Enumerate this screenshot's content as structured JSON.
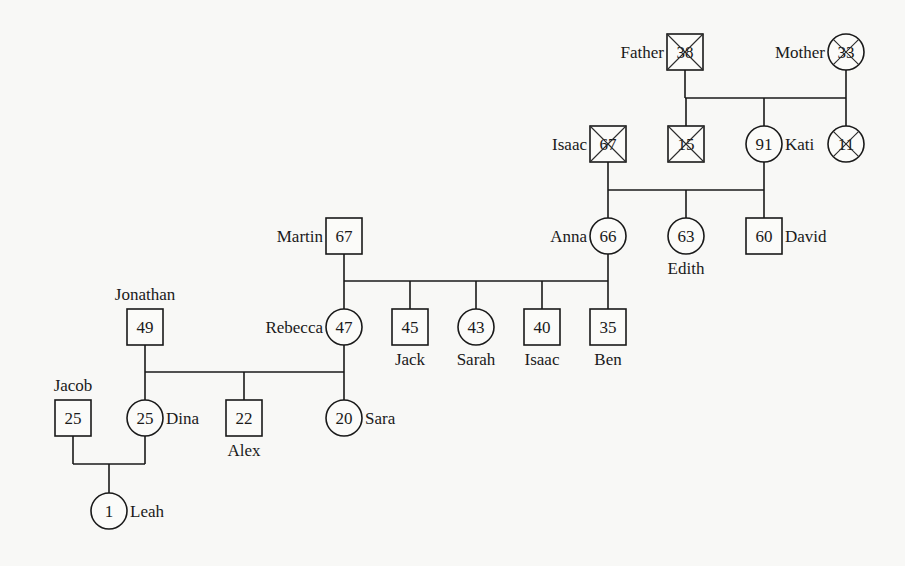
{
  "diagram": {
    "type": "pedigree",
    "colors": {
      "background": "#f8f8f6",
      "stroke": "#1a1a1a"
    },
    "people": [
      {
        "id": "father",
        "name": "Father",
        "age": "38",
        "sex": "male",
        "deceased": true,
        "x": 685,
        "y": 52,
        "label_pos": "left"
      },
      {
        "id": "mother",
        "name": "Mother",
        "age": "33",
        "sex": "female",
        "deceased": true,
        "x": 846,
        "y": 52,
        "label_pos": "left"
      },
      {
        "id": "isaac_sr",
        "name": "Isaac",
        "age": "67",
        "sex": "male",
        "deceased": true,
        "x": 608,
        "y": 144,
        "label_pos": "left"
      },
      {
        "id": "son15",
        "name": "",
        "age": "15",
        "sex": "male",
        "deceased": true,
        "x": 686,
        "y": 144,
        "label_pos": "none"
      },
      {
        "id": "kati",
        "name": "Kati",
        "age": "91",
        "sex": "female",
        "deceased": false,
        "x": 764,
        "y": 144,
        "label_pos": "right"
      },
      {
        "id": "daughter11",
        "name": "",
        "age": "11",
        "sex": "female",
        "deceased": true,
        "x": 846,
        "y": 144,
        "label_pos": "none"
      },
      {
        "id": "martin",
        "name": "Martin",
        "age": "67",
        "sex": "male",
        "deceased": false,
        "x": 344,
        "y": 236,
        "label_pos": "left"
      },
      {
        "id": "anna",
        "name": "Anna",
        "age": "66",
        "sex": "female",
        "deceased": false,
        "x": 608,
        "y": 236,
        "label_pos": "left"
      },
      {
        "id": "edith",
        "name": "Edith",
        "age": "63",
        "sex": "female",
        "deceased": false,
        "x": 686,
        "y": 236,
        "label_pos": "below"
      },
      {
        "id": "david",
        "name": "David",
        "age": "60",
        "sex": "male",
        "deceased": false,
        "x": 764,
        "y": 236,
        "label_pos": "right"
      },
      {
        "id": "jonathan",
        "name": "Jonathan",
        "age": "49",
        "sex": "male",
        "deceased": false,
        "x": 145,
        "y": 327,
        "label_pos": "above"
      },
      {
        "id": "rebecca",
        "name": "Rebecca",
        "age": "47",
        "sex": "female",
        "deceased": false,
        "x": 344,
        "y": 327,
        "label_pos": "left"
      },
      {
        "id": "jack",
        "name": "Jack",
        "age": "45",
        "sex": "male",
        "deceased": false,
        "x": 410,
        "y": 327,
        "label_pos": "below"
      },
      {
        "id": "sarah",
        "name": "Sarah",
        "age": "43",
        "sex": "female",
        "deceased": false,
        "x": 476,
        "y": 327,
        "label_pos": "below"
      },
      {
        "id": "isaac_jr",
        "name": "Isaac",
        "age": "40",
        "sex": "male",
        "deceased": false,
        "x": 542,
        "y": 327,
        "label_pos": "below"
      },
      {
        "id": "ben",
        "name": "Ben",
        "age": "35",
        "sex": "male",
        "deceased": false,
        "x": 608,
        "y": 327,
        "label_pos": "below"
      },
      {
        "id": "jacob",
        "name": "Jacob",
        "age": "25",
        "sex": "male",
        "deceased": false,
        "x": 73,
        "y": 418,
        "label_pos": "above"
      },
      {
        "id": "dina",
        "name": "Dina",
        "age": "25",
        "sex": "female",
        "deceased": false,
        "x": 145,
        "y": 418,
        "label_pos": "right"
      },
      {
        "id": "alex",
        "name": "Alex",
        "age": "22",
        "sex": "male",
        "deceased": false,
        "x": 244,
        "y": 418,
        "label_pos": "below"
      },
      {
        "id": "sara",
        "name": "Sara",
        "age": "20",
        "sex": "female",
        "deceased": false,
        "x": 344,
        "y": 418,
        "label_pos": "right"
      },
      {
        "id": "leah",
        "name": "Leah",
        "age": "1",
        "sex": "female",
        "deceased": false,
        "x": 109,
        "y": 511,
        "label_pos": "right"
      }
    ],
    "lines": [
      [
        685,
        70,
        685,
        98
      ],
      [
        846,
        70,
        846,
        98
      ],
      [
        685,
        98,
        846,
        98
      ],
      [
        686,
        98,
        686,
        126
      ],
      [
        764,
        98,
        764,
        126
      ],
      [
        846,
        98,
        846,
        126
      ],
      [
        608,
        162,
        608,
        190
      ],
      [
        764,
        162,
        764,
        190
      ],
      [
        608,
        190,
        764,
        190
      ],
      [
        608,
        190,
        608,
        218
      ],
      [
        686,
        190,
        686,
        218
      ],
      [
        764,
        190,
        764,
        218
      ],
      [
        344,
        254,
        344,
        281
      ],
      [
        608,
        254,
        608,
        281
      ],
      [
        344,
        281,
        608,
        281
      ],
      [
        344,
        281,
        344,
        309
      ],
      [
        410,
        281,
        410,
        309
      ],
      [
        476,
        281,
        476,
        309
      ],
      [
        542,
        281,
        542,
        309
      ],
      [
        608,
        281,
        608,
        309
      ],
      [
        145,
        345,
        145,
        372
      ],
      [
        344,
        345,
        344,
        372
      ],
      [
        145,
        372,
        344,
        372
      ],
      [
        145,
        372,
        145,
        400
      ],
      [
        244,
        372,
        244,
        400
      ],
      [
        344,
        372,
        344,
        400
      ],
      [
        73,
        436,
        73,
        464
      ],
      [
        145,
        436,
        145,
        464
      ],
      [
        73,
        464,
        145,
        464
      ],
      [
        109,
        464,
        109,
        493
      ]
    ]
  }
}
